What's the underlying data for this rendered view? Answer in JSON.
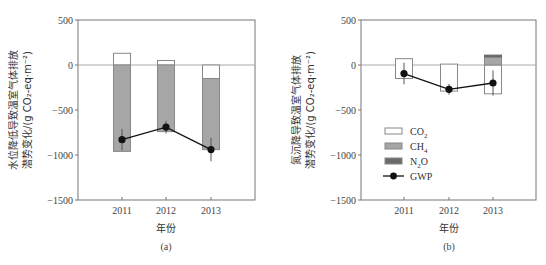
{
  "chart_data": [
    {
      "type": "bar",
      "panel_label": "(a)",
      "title": "",
      "xlabel": "年份",
      "ylabel_line1": "水位降低导致温室气体排放",
      "ylabel_line2": "潜势变化/(g CO₂-eq·m⁻²)",
      "ylim": [
        -1500,
        500
      ],
      "yticks": [
        "500",
        "0",
        "−500",
        "−1000",
        "−1500"
      ],
      "categories": [
        "2011",
        "2012",
        "2013"
      ],
      "stacked": true,
      "series": [
        {
          "name": "CO₂",
          "values": [
            130,
            50,
            -150
          ],
          "color": "#ffffff"
        },
        {
          "name": "CH₄",
          "values": [
            -960,
            -740,
            -790
          ],
          "color": "#a6a6a6"
        },
        {
          "name": "N₂O",
          "values": [
            0,
            0,
            0
          ],
          "color": "#6b6b6b"
        }
      ],
      "line_series": {
        "name": "GWP",
        "values": [
          -830,
          -690,
          -940
        ],
        "error": [
          120,
          70,
          130
        ],
        "color": "#111111"
      }
    },
    {
      "type": "bar",
      "panel_label": "(b)",
      "title": "",
      "xlabel": "年份",
      "ylabel_line1": "氮沉降导致温室气体排放",
      "ylabel_line2": "潜势变化/(g CO₂-eq·m⁻²)",
      "ylim": [
        -1500,
        500
      ],
      "yticks": [
        "500",
        "0",
        "−500",
        "−1000",
        "−1500"
      ],
      "categories": [
        "2011",
        "2012",
        "2013"
      ],
      "stacked": true,
      "series": [
        {
          "name": "CO₂",
          "values_pos": [
            70,
            10,
            0
          ],
          "values_neg": [
            -150,
            -290,
            -320
          ],
          "color": "#ffffff"
        },
        {
          "name": "CH₄",
          "values": [
            0,
            0,
            90
          ],
          "color": "#a6a6a6"
        },
        {
          "name": "N₂O",
          "values": [
            0,
            0,
            20
          ],
          "color": "#6b6b6b"
        }
      ],
      "line_series": {
        "name": "GWP",
        "values": [
          -95,
          -270,
          -200
        ],
        "error": [
          120,
          60,
          140
        ],
        "color": "#111111"
      },
      "legend": [
        "CO₂",
        "CH₄",
        "N₂O",
        "GWP"
      ],
      "legend_position": "lower-left inside"
    }
  ],
  "figure": {
    "legend_items": [
      {
        "label": "CO",
        "sub": "2"
      },
      {
        "label": "CH",
        "sub": "4"
      },
      {
        "label": "N",
        "sub": "2",
        "suffix": "O"
      },
      {
        "label": "GWP",
        "sub": ""
      }
    ]
  }
}
